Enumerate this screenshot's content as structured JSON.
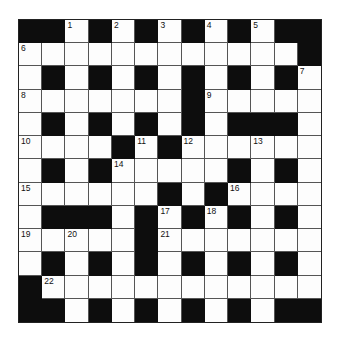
{
  "puzzle": {
    "rows": 13,
    "cols": 13,
    "colors": {
      "black": "#0d0d0d",
      "white": "#fdfdfd",
      "line": "#555555"
    },
    "grid": [
      "##1#2#3#4#5##",
      "6..........#",
      ".#.#.#.#.#.#7",
      "8......#9....",
      ".#.#.#.#.###.",
      "10...#11#12..13..",
      ".#.#14....#.#.",
      "15.....#.#16...",
      ".###.#17#18#.#.",
      "1920...#21......",
      ".#.#.#.#.#.#.",
      "#22...........",
      "##.#.#.#.#.##"
    ],
    "cells": [
      [
        "B",
        "B",
        "1",
        "B",
        "2",
        "B",
        "3",
        "B",
        "4",
        "B",
        "5",
        "B",
        "B"
      ],
      [
        "6",
        "W",
        "W",
        "W",
        "W",
        "W",
        "W",
        "W",
        "W",
        "W",
        "W",
        "W",
        "B"
      ],
      [
        "W",
        "B",
        "W",
        "B",
        "W",
        "B",
        "W",
        "B",
        "W",
        "B",
        "W",
        "B",
        "7"
      ],
      [
        "8",
        "W",
        "W",
        "W",
        "W",
        "W",
        "W",
        "B",
        "9",
        "W",
        "W",
        "W",
        "W"
      ],
      [
        "W",
        "B",
        "W",
        "B",
        "W",
        "B",
        "W",
        "B",
        "W",
        "B",
        "B",
        "B",
        "W"
      ],
      [
        "10",
        "W",
        "W",
        "W",
        "B",
        "11",
        "B",
        "12",
        "W",
        "W",
        "13",
        "W",
        "W"
      ],
      [
        "W",
        "B",
        "W",
        "B",
        "14",
        "W",
        "W",
        "W",
        "W",
        "B",
        "W",
        "B",
        "W"
      ],
      [
        "15",
        "W",
        "W",
        "W",
        "W",
        "W",
        "B",
        "W",
        "B",
        "16",
        "W",
        "W",
        "W"
      ],
      [
        "W",
        "B",
        "B",
        "B",
        "W",
        "B",
        "17",
        "B",
        "18",
        "B",
        "W",
        "B",
        "W"
      ],
      [
        "19",
        "W",
        "20",
        "W",
        "W",
        "B",
        "21",
        "W",
        "W",
        "W",
        "W",
        "W",
        "W"
      ],
      [
        "W",
        "B",
        "W",
        "B",
        "W",
        "B",
        "W",
        "B",
        "W",
        "B",
        "W",
        "B",
        "W"
      ],
      [
        "B",
        "22",
        "W",
        "W",
        "W",
        "W",
        "W",
        "W",
        "W",
        "W",
        "W",
        "W",
        "W"
      ],
      [
        "B",
        "B",
        "W",
        "B",
        "W",
        "B",
        "W",
        "B",
        "W",
        "B",
        "W",
        "B",
        "B"
      ]
    ]
  }
}
